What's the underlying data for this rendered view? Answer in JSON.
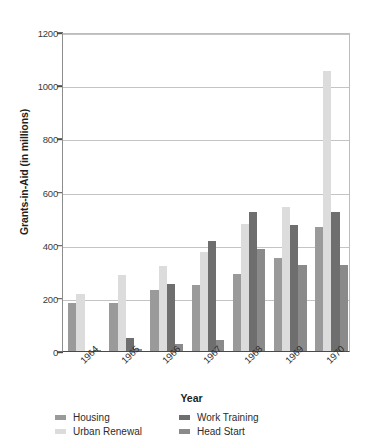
{
  "chart_data": {
    "type": "bar",
    "title": "",
    "xlabel": "Year",
    "ylabel": "Grants-in-Aid (in millions)",
    "categories": [
      "1964",
      "1965",
      "1966",
      "1967",
      "1968",
      "1969",
      "1970"
    ],
    "ylim": [
      0,
      1200
    ],
    "yticks": [
      0,
      200,
      400,
      600,
      800,
      1000,
      1200
    ],
    "ytick_labels": [
      "0",
      "200",
      "400",
      "600",
      "800",
      "1000",
      "1200"
    ],
    "grid": true,
    "legend_position": "bottom",
    "series": [
      {
        "name": "Housing",
        "color": "#9a9a9a",
        "values": [
          182,
          181,
          230,
          250,
          290,
          350,
          465
        ]
      },
      {
        "name": "Urban Renewal",
        "color": "#dcdcdc",
        "values": [
          213,
          285,
          318,
          373,
          477,
          540,
          1055
        ]
      },
      {
        "name": "Work Training",
        "color": "#6e6e6e",
        "values": [
          0,
          48,
          253,
          414,
          522,
          475,
          522
        ]
      },
      {
        "name": "Head Start",
        "color": "#8a8a8a",
        "values": [
          3,
          8,
          26,
          40,
          383,
          325,
          322
        ]
      }
    ]
  },
  "legend": {
    "entries": [
      {
        "label": "Housing"
      },
      {
        "label": "Work Training"
      },
      {
        "label": "Urban Renewal"
      },
      {
        "label": "Head Start"
      }
    ]
  }
}
